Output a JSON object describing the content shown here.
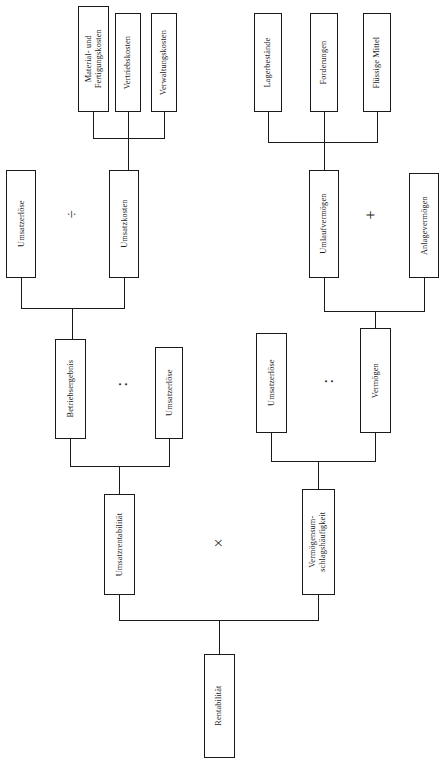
{
  "diagram": {
    "language": "de",
    "orientation": "rotated-90-ccw",
    "stroke_color": "#1a1a1a",
    "background_color": "#ffffff"
  },
  "nodes": {
    "material_fertigungskosten": "Material- und\nFertigungskosten",
    "vertriebskosten": "Vertriebskosten",
    "verwaltungskosten": "Verwaltungskosten",
    "lagerbestaende": "Lagerbestände",
    "forderungen": "Forderungen",
    "fluessige_mittel": "Flüssige Mittel",
    "umsatzerloese_l1": "Umsatzerlöse",
    "umsatzkosten": "Umsatzkosten",
    "umlaufvermoegen": "Umlaufvermögen",
    "anlagevermoegen": "Anlagevermögen",
    "betriebsergebnis": "Betriebsergebnis",
    "umsatzerloese_l2": "Umsatzerlöse",
    "umsatzerloese_r2": "Umsatzerlöse",
    "vermoegen": "Vermögen",
    "umsatzrentabilitaet": "Umsatzrentabilität",
    "vermoegensumschlagshaeufigkeit": "Vermögensum-\nschlagshäufigkeit",
    "rentabilitaet": "Rentabilität"
  },
  "operators": {
    "minus_division_left": "÷",
    "plus_right": "+",
    "colon_left": ":",
    "colon_right": ":",
    "times_bottom": "×"
  }
}
